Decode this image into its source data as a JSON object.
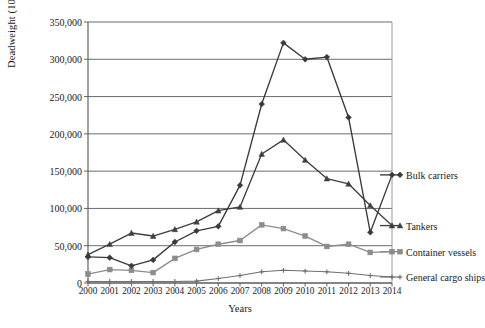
{
  "chart_data": {
    "type": "line",
    "title": "",
    "xlabel": "Years",
    "ylabel": "Deadweight (1000 tonnes)",
    "categories": [
      2000,
      2001,
      2002,
      2003,
      2004,
      2005,
      2006,
      2007,
      2008,
      2009,
      2010,
      2011,
      2012,
      2013,
      2014
    ],
    "x_tick_labels": [
      "2000",
      "2001",
      "2002",
      "2003",
      "2004",
      "2005",
      "2006",
      "2007",
      "2008",
      "2009",
      "2010",
      "2011",
      "2012",
      "2013",
      "2014"
    ],
    "y_tick_labels": [
      "0",
      "50,000",
      "100,000",
      "150,000",
      "200,000",
      "250,000",
      "300,000",
      "350,000"
    ],
    "y_tick_values": [
      0,
      50000,
      100000,
      150000,
      200000,
      250000,
      300000,
      350000
    ],
    "ylim": [
      0,
      350000
    ],
    "grid": "horizontal",
    "legend_position": "right-inline",
    "series": [
      {
        "name": "Bulk carriers",
        "color": "#3a3a3a",
        "marker": "diamond",
        "values": [
          35000,
          34000,
          23000,
          31000,
          55000,
          70000,
          76000,
          131000,
          240000,
          322000,
          300000,
          303000,
          222000,
          68000,
          145000
        ]
      },
      {
        "name": "Tankers",
        "color": "#3f3f3f",
        "marker": "triangle",
        "values": [
          38000,
          52000,
          67000,
          63000,
          72000,
          82000,
          97000,
          102000,
          173000,
          192000,
          165000,
          140000,
          133000,
          104000,
          77000
        ]
      },
      {
        "name": "Container vessels",
        "color": "#8c8c8c",
        "marker": "square",
        "values": [
          12000,
          18000,
          17000,
          14000,
          33000,
          45000,
          52000,
          57000,
          78000,
          73000,
          63000,
          49000,
          52000,
          41000,
          42000
        ]
      },
      {
        "name": "General cargo ships",
        "color": "#6f6f6f",
        "marker": "plus",
        "values": [
          2000,
          2000,
          2000,
          2000,
          2000,
          2500,
          6000,
          10000,
          15000,
          17000,
          16000,
          15000,
          13000,
          10000,
          8000
        ]
      }
    ]
  },
  "axes": {
    "y_title": "Deadweight (1000 tonnes)",
    "x_title": "Years"
  },
  "colors": {
    "axis": "#555555",
    "grid": "#5a5a5a",
    "text": "#1a1a1a",
    "background": "#ffffff"
  }
}
